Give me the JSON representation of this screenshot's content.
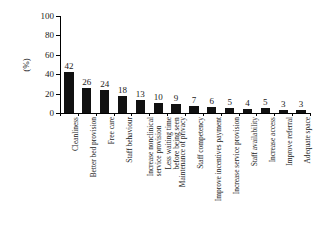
{
  "chart_data": {
    "type": "bar",
    "title": "",
    "subtitle": "",
    "xlabel": "",
    "ylabel": "(%)",
    "ylim": [
      0,
      100
    ],
    "yticks": [
      0,
      20,
      40,
      60,
      80,
      100
    ],
    "grid": false,
    "legend": false,
    "bar_color": "#111111",
    "categories": [
      "Cleanliness",
      "Better bed provision",
      "Free care",
      "Staff behaviour",
      "Increase nonclinical service provision",
      "Less waiting time before being seen",
      "Maintenance of privacy",
      "Staff competency",
      "Improve incentives payment",
      "Increase service provision",
      "Staff availability",
      "Increase access",
      "Improve referral",
      "Adequate space"
    ],
    "values": [
      42,
      26,
      24,
      18,
      13,
      10,
      9,
      7,
      6,
      5,
      4,
      5,
      3,
      3
    ],
    "value_labels": [
      "42",
      "26",
      "24",
      "18",
      "13",
      "10",
      "9",
      "7",
      "6",
      "5",
      "4",
      "5",
      "3",
      "3"
    ],
    "category_lines": [
      [
        "Cleanliness",
        ""
      ],
      [
        "Better bed provision",
        ""
      ],
      [
        "Free care",
        ""
      ],
      [
        "Staff behaviour",
        ""
      ],
      [
        "Increase nonclinical",
        "service provision"
      ],
      [
        "Less waiting time",
        "before being seen"
      ],
      [
        "Maintenance of privacy",
        ""
      ],
      [
        "Staff competency",
        ""
      ],
      [
        "Improve incentives payment",
        ""
      ],
      [
        "Increase service provision",
        ""
      ],
      [
        "Staff availability",
        ""
      ],
      [
        "Increase access",
        ""
      ],
      [
        "Improve referral",
        ""
      ],
      [
        "Adequate space",
        ""
      ]
    ],
    "ytick_labels": [
      "0",
      "20",
      "40",
      "60",
      "80",
      "100"
    ]
  },
  "axes": {
    "y_title": "(%)"
  }
}
